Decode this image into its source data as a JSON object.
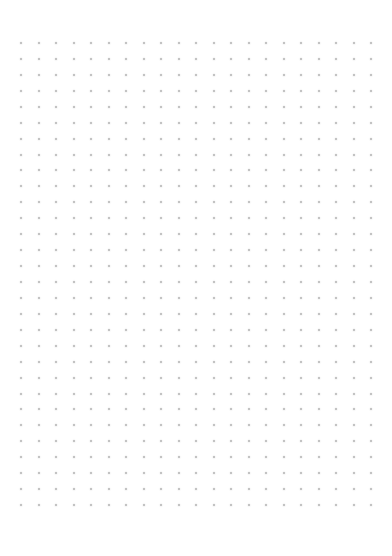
{
  "page": {
    "type": "dot-grid-sheet",
    "background_color": "#ffffff",
    "dot_color": "#9e9e9e"
  },
  "grid": {
    "columns": 21,
    "rows": 30
  }
}
